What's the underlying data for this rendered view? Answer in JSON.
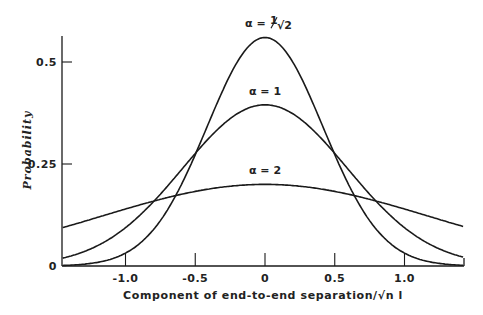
{
  "chart_data": {
    "type": "line",
    "title": "",
    "xlabel": "Component of end-to-end separation/√n l",
    "ylabel": "Probability",
    "xlim": [
      -1.45,
      1.42
    ],
    "ylim": [
      0,
      0.56
    ],
    "grid": false,
    "legend": "inline labels above each curve",
    "x_ticks": [
      {
        "value": -1.0,
        "label": "-1.0"
      },
      {
        "value": -0.5,
        "label": "-0.5"
      },
      {
        "value": 0,
        "label": "0"
      },
      {
        "value": 0.5,
        "label": "0.5"
      },
      {
        "value": 1.0,
        "label": "1.0"
      }
    ],
    "y_ticks": [
      {
        "value": 0,
        "label": "0"
      },
      {
        "value": 0.25,
        "label": "0.25"
      },
      {
        "value": 0.5,
        "label": "0.5"
      }
    ],
    "series": [
      {
        "name": "α = 1/√2",
        "label_main": "α = ",
        "label_frac_num": "1",
        "label_frac_den": "√2",
        "peak": 0.56,
        "alpha": 0.7071,
        "label_x": 0,
        "label_y": 0.585
      },
      {
        "name": "α = 1",
        "label_main": "α = 1",
        "peak": 0.395,
        "alpha": 1.0,
        "label_x": 0,
        "label_y": 0.42
      },
      {
        "name": "α = 2",
        "label_main": "α = 2",
        "peak": 0.2,
        "alpha": 2.0,
        "label_x": 0,
        "label_y": 0.225
      }
    ],
    "x": [
      -1.4,
      -1.0,
      -0.5,
      0,
      0.5,
      1.0,
      1.4
    ],
    "values_by_series": {
      "α = 1/√2": [
        0.0,
        0.013,
        0.154,
        0.56,
        0.154,
        0.013,
        0.0
      ],
      "α = 1": [
        0.025,
        0.094,
        0.276,
        0.395,
        0.276,
        0.094,
        0.025
      ],
      "α = 2": [
        0.101,
        0.155,
        0.183,
        0.2,
        0.183,
        0.155,
        0.101
      ]
    },
    "shape_width_factor": 0.59
  }
}
